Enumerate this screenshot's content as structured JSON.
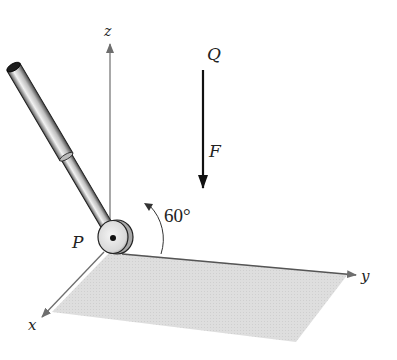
{
  "figure": {
    "labels": {
      "z_axis": "z",
      "x_axis": "x",
      "y_axis": "y",
      "point_p": "P",
      "point_q": "Q",
      "force": "F",
      "angle": "60°"
    },
    "colors": {
      "axis": "#6e6e6e",
      "plane": "#d9d9d9",
      "rod_dark": "#3a3a3a",
      "rod_light": "#e6e6e6",
      "force": "#111111"
    }
  }
}
